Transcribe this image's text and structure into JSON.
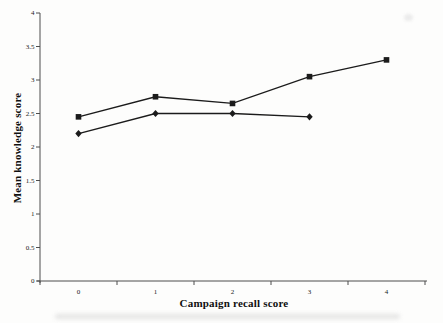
{
  "figure": {
    "background_color": "#fdfdfc",
    "axis_color": "#4d4d4d",
    "series_color": "#1b1b1b",
    "tick_label_color": "#222222"
  },
  "chart_data": {
    "type": "line",
    "title": "",
    "xlabel": "Campaign recall score",
    "ylabel": "Mean knowledge score",
    "categories": [
      "0",
      "1",
      "2",
      "3",
      "4"
    ],
    "y_tick_labels": [
      "0",
      "0.5",
      "1",
      "1.5",
      "2",
      "2.5",
      "3",
      "3.5",
      "4"
    ],
    "ylim": [
      0,
      4
    ],
    "grid": false,
    "legend": "none",
    "series": [
      {
        "name": "square-marker-series",
        "marker": "square",
        "color": "#1b1b1b",
        "x": [
          0,
          1,
          2,
          3,
          4
        ],
        "values": [
          2.45,
          2.75,
          2.65,
          3.05,
          3.3
        ]
      },
      {
        "name": "diamond-marker-series",
        "marker": "diamond",
        "color": "#1b1b1b",
        "x": [
          0,
          1,
          2,
          3
        ],
        "values": [
          2.2,
          2.5,
          2.5,
          2.45
        ]
      }
    ]
  }
}
